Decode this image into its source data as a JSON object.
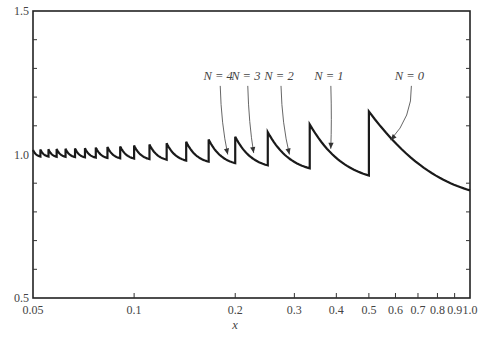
{
  "chart_data": {
    "type": "line",
    "title": "",
    "xlabel": "x",
    "ylabel": "",
    "xscale": "log",
    "xlim": [
      0.05,
      1.0
    ],
    "ylim": [
      0.5,
      1.5
    ],
    "grid": false,
    "x_ticks": [
      0.05,
      0.1,
      0.2,
      0.3,
      0.4,
      0.5,
      0.6,
      0.7,
      0.8,
      0.9,
      1.0
    ],
    "x_tick_labels": [
      "0.05",
      "0.1",
      "0.2",
      "0.3",
      "0.4",
      "0.5",
      "0.6",
      "0.7",
      "0.8",
      "0.9",
      "1.0"
    ],
    "y_tick_labels": [
      {
        "value": 1.5,
        "label": "1.5"
      },
      {
        "value": 1.0,
        "label": "1.0"
      },
      {
        "value": 0.5,
        "label": "0.5"
      }
    ],
    "y_minor_ticks": [
      0.6,
      0.7,
      0.8,
      0.9,
      1.1,
      1.2,
      1.3,
      1.4
    ],
    "series": [
      {
        "name": "sawtooth curve",
        "description": "Piecewise decaying segments on intervals (1/(N+2), 1/(N+1)] with jumps at x = 1/(N+1)",
        "segments": [
          {
            "N": 0,
            "x_start": 0.5,
            "x_end": 1.0,
            "y_start": 1.15,
            "y_end": 0.875
          },
          {
            "N": 1,
            "x_start": 0.3333,
            "x_end": 0.5,
            "y_start": 1.105,
            "y_end": 0.927
          },
          {
            "N": 2,
            "x_start": 0.25,
            "x_end": 0.3333,
            "y_start": 1.078,
            "y_end": 0.952
          },
          {
            "N": 3,
            "x_start": 0.2,
            "x_end": 0.25,
            "y_start": 1.062,
            "y_end": 0.962
          },
          {
            "N": 4,
            "x_start": 0.1667,
            "x_end": 0.2,
            "y_start": 1.052,
            "y_end": 0.97
          },
          {
            "N": 5,
            "x_start": 0.1429,
            "x_end": 0.1667,
            "y_start": 1.044,
            "y_end": 0.975
          },
          {
            "N": 6,
            "x_start": 0.125,
            "x_end": 0.1429,
            "y_start": 1.039,
            "y_end": 0.979
          },
          {
            "N": 7,
            "x_start": 0.1111,
            "x_end": 0.125,
            "y_start": 1.035,
            "y_end": 0.982
          },
          {
            "N": 8,
            "x_start": 0.1,
            "x_end": 0.1111,
            "y_start": 1.031,
            "y_end": 0.984
          },
          {
            "N": 9,
            "x_start": 0.0909,
            "x_end": 0.1,
            "y_start": 1.028,
            "y_end": 0.986
          },
          {
            "N": 10,
            "x_start": 0.0833,
            "x_end": 0.0909,
            "y_start": 1.026,
            "y_end": 0.987
          },
          {
            "N": 11,
            "x_start": 0.0769,
            "x_end": 0.0833,
            "y_start": 1.024,
            "y_end": 0.988
          },
          {
            "N": 12,
            "x_start": 0.0714,
            "x_end": 0.0769,
            "y_start": 1.022,
            "y_end": 0.989
          },
          {
            "N": 13,
            "x_start": 0.0667,
            "x_end": 0.0714,
            "y_start": 1.021,
            "y_end": 0.99
          },
          {
            "N": 14,
            "x_start": 0.0625,
            "x_end": 0.0667,
            "y_start": 1.02,
            "y_end": 0.991
          },
          {
            "N": 15,
            "x_start": 0.0588,
            "x_end": 0.0625,
            "y_start": 1.019,
            "y_end": 0.992
          },
          {
            "N": 16,
            "x_start": 0.0556,
            "x_end": 0.0588,
            "y_start": 1.018,
            "y_end": 0.992
          },
          {
            "N": 17,
            "x_start": 0.0526,
            "x_end": 0.0556,
            "y_start": 1.017,
            "y_end": 0.993
          },
          {
            "N": 18,
            "x_start": 0.05,
            "x_end": 0.0526,
            "y_start": 1.016,
            "y_end": 0.993
          }
        ]
      }
    ],
    "annotations": [
      {
        "label": "N = 4",
        "text_x": 0.178,
        "text_y": 1.26,
        "arrow_to_x": 0.19,
        "arrow_to_y": 1.0
      },
      {
        "label": "N = 3",
        "text_x": 0.215,
        "text_y": 1.26,
        "arrow_to_x": 0.227,
        "arrow_to_y": 1.005
      },
      {
        "label": "N = 2",
        "text_x": 0.27,
        "text_y": 1.26,
        "arrow_to_x": 0.29,
        "arrow_to_y": 1.0
      },
      {
        "label": "N = 1",
        "text_x": 0.38,
        "text_y": 1.26,
        "arrow_to_x": 0.385,
        "arrow_to_y": 1.02
      },
      {
        "label": "N = 0",
        "text_x": 0.66,
        "text_y": 1.26,
        "arrow_to_x": 0.58,
        "arrow_to_y": 1.05
      }
    ]
  }
}
